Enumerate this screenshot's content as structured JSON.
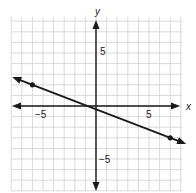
{
  "chart_data": {
    "type": "line",
    "title": "",
    "xlabel": "x",
    "ylabel": "y",
    "xlim": [
      -8,
      8
    ],
    "ylim": [
      -8,
      8
    ],
    "grid": true,
    "grid_step": 1,
    "x_tick_labels": [
      {
        "value": -5,
        "label": "−5"
      },
      {
        "value": 5,
        "label": "5"
      }
    ],
    "y_tick_labels": [
      {
        "value": 5,
        "label": "5"
      },
      {
        "value": -5,
        "label": "−5"
      }
    ],
    "series": [
      {
        "name": "line",
        "points": [
          {
            "x": -6,
            "y": 2
          },
          {
            "x": 7,
            "y": -3
          }
        ],
        "extends_both_directions": true
      }
    ]
  },
  "colors": {
    "grid": "#cfcfcf",
    "axis": "#1a1a1a",
    "line": "#1a1a1a"
  }
}
